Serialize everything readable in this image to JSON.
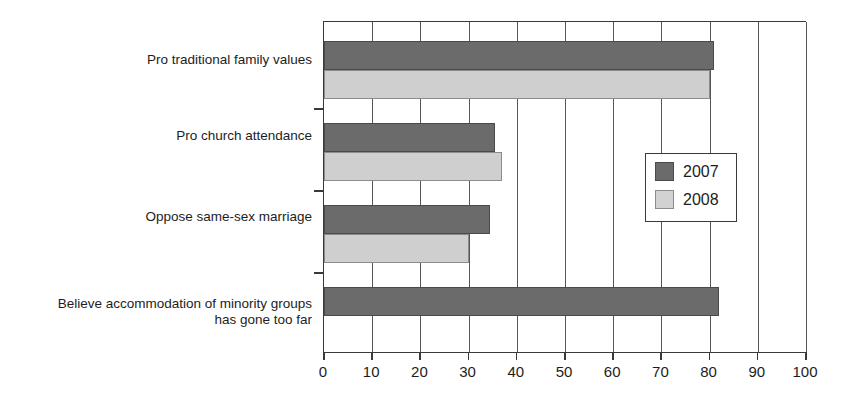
{
  "chart_data": {
    "type": "bar",
    "orientation": "horizontal",
    "title": "",
    "xlabel": "",
    "ylabel": "",
    "xlim": [
      0,
      100
    ],
    "xticks": [
      0,
      10,
      20,
      30,
      40,
      50,
      60,
      70,
      80,
      90,
      100
    ],
    "xtick_labels": [
      "0",
      "10",
      "20",
      "30",
      "40",
      "50",
      "60",
      "70",
      "80",
      "90",
      "100"
    ],
    "grid": true,
    "grid_axis": "x",
    "categories": [
      "Pro traditional family values",
      "Pro church attendance",
      "Oppose same-sex marriage",
      "Believe accommodation of minority groups\nhas gone too far"
    ],
    "series": [
      {
        "name": "2007",
        "color": "#6b6b6b",
        "values": [
          81,
          35.5,
          34.5,
          82
        ]
      },
      {
        "name": "2008",
        "color": "#cfcfcf",
        "values": [
          80,
          37,
          30,
          null
        ]
      }
    ],
    "legend": {
      "position": "center-right",
      "entries": [
        {
          "label": "2007",
          "color": "#6b6b6b"
        },
        {
          "label": "2008",
          "color": "#cfcfcf"
        }
      ]
    }
  },
  "axis": {
    "tick_color": "#3a3a3a",
    "gridline_color": "#555555"
  }
}
